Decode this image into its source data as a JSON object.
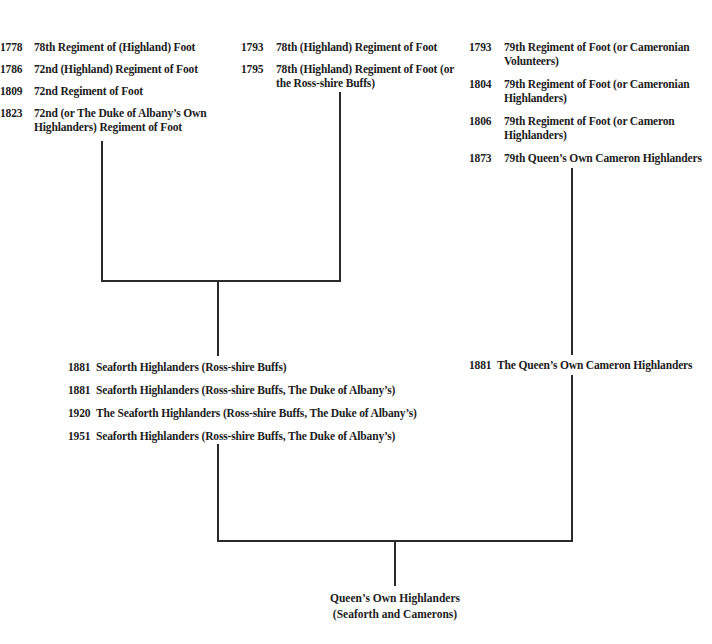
{
  "diagram": {
    "type": "regimental-lineage-tree",
    "branches": {
      "col1": [
        {
          "year": "1778",
          "name": "78th Regiment of (Highland) Foot"
        },
        {
          "year": "1786",
          "name": "72nd (Highland) Regiment of Foot"
        },
        {
          "year": "1809",
          "name": "72nd Regiment of Foot"
        },
        {
          "year": "1823",
          "name": "72nd (or The Duke of Albany’s Own",
          "name2": "Highlanders) Regiment of Foot"
        }
      ],
      "col2": [
        {
          "year": "1793",
          "name": "78th (Highland) Regiment of Foot"
        },
        {
          "year": "1795",
          "name": "78th (Highland) Regiment of Foot (or",
          "name2": "the Ross-shire Buffs)"
        }
      ],
      "col3": [
        {
          "year": "1793",
          "name": "79th Regiment of Foot (or Cameronian",
          "name2": "Volunteers)"
        },
        {
          "year": "1804",
          "name": "79th Regiment of Foot (or Cameronian",
          "name2": "Highlanders)"
        },
        {
          "year": "1806",
          "name": "79th Regiment of Foot (or Cameron",
          "name2": "Highlanders)"
        },
        {
          "year": "1873",
          "name": "79th Queen’s Own Cameron Highlanders"
        }
      ],
      "seaforth": [
        {
          "year": "1881",
          "name": "Seaforth Highlanders (Ross-shire Buffs)"
        },
        {
          "year": "1881",
          "name": "Seaforth Highlanders (Ross-shire Buffs, The Duke of Albany’s)"
        },
        {
          "year": "1920",
          "name": "The Seaforth Highlanders (Ross-shire Buffs, The Duke of Albany’s)"
        },
        {
          "year": "1951",
          "name": "Seaforth Highlanders (Ross-shire Buffs, The Duke of Albany’s)"
        }
      ],
      "cameron": [
        {
          "year": "1881",
          "name": "The Queen’s Own Cameron Highlanders"
        }
      ]
    },
    "final": {
      "line1": "Queen’s Own Highlanders",
      "line2": "(Seaforth and Camerons)"
    }
  }
}
